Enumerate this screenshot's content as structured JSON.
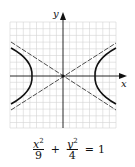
{
  "graph": {
    "type": "hyperbola",
    "x_axis_label": "x",
    "y_axis_label": "y",
    "grid": true,
    "grid_color": "#cfcfcf",
    "curve_color": "#111111",
    "asymptote_style": "dashed"
  },
  "equation": {
    "term1_num_var": "x",
    "term1_num_exp": "2",
    "term1_den": "9",
    "operator": "+",
    "term2_num_var": "y",
    "term2_num_exp": "2",
    "term2_den": "4",
    "equals": "=",
    "rhs": "1"
  }
}
